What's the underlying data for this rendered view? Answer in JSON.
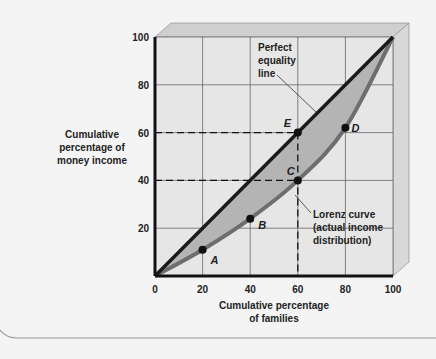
{
  "chart_data": {
    "type": "line",
    "title": "",
    "xlabel": "Cumulative percentage of families",
    "ylabel": "Cumulative percentage of money income",
    "xlabel_lines": [
      "Cumulative percentage",
      "of families"
    ],
    "ylabel_lines": [
      "Cumulative",
      "percentage of",
      "money income"
    ],
    "xlim": [
      0,
      100
    ],
    "ylim": [
      0,
      100
    ],
    "x_ticks": [
      "0",
      "20",
      "40",
      "60",
      "80",
      "100"
    ],
    "y_ticks": [
      "20",
      "40",
      "60",
      "80",
      "100"
    ],
    "grid": true,
    "series": [
      {
        "name": "Perfect equality line",
        "x": [
          0,
          100
        ],
        "y": [
          0,
          100
        ]
      },
      {
        "name": "Lorenz curve (actual income distribution)",
        "x": [
          0,
          20,
          40,
          60,
          80,
          100
        ],
        "y": [
          0,
          11,
          24,
          40,
          62,
          100
        ]
      }
    ],
    "points": [
      {
        "label": "A",
        "x": 20,
        "y": 11
      },
      {
        "label": "B",
        "x": 40,
        "y": 24
      },
      {
        "label": "C",
        "x": 60,
        "y": 40
      },
      {
        "label": "D",
        "x": 80,
        "y": 62
      },
      {
        "label": "E",
        "x": 60,
        "y": 60
      }
    ],
    "annotations": [
      {
        "text_lines": [
          "Perfect",
          "equality",
          "line"
        ]
      },
      {
        "text_lines": [
          "Lorenz curve",
          "(actual income",
          "distribution)"
        ]
      }
    ],
    "colors": {
      "equality": "#1a1a1a",
      "lorenz": "#6e6e6e",
      "shade": "#b4b4b4",
      "face": "#e6e6e6"
    }
  }
}
